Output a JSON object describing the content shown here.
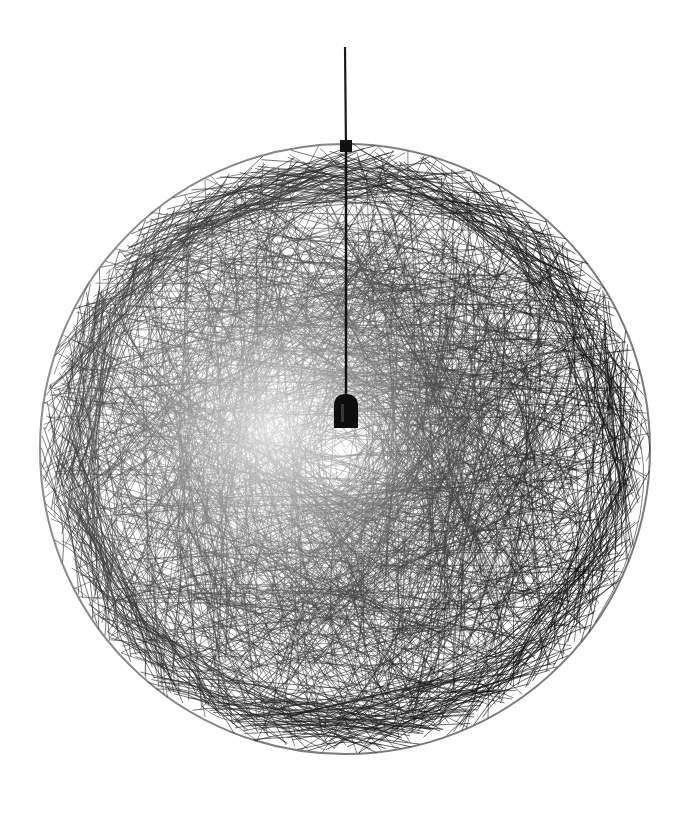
{
  "image": {
    "subject": "Spherical black fiber-mesh pendant lamp",
    "background_color": "#ffffff",
    "fiber_color": "#111111",
    "cord_color": "#1a1a1a",
    "socket_color": "#0d0d0d"
  },
  "geometry": {
    "width": 688,
    "height": 814,
    "sphere_center": [
      345,
      449
    ],
    "sphere_radius": 306,
    "cord_top_y": 47,
    "socket_top_y": 395,
    "socket_size": [
      24,
      32
    ]
  }
}
